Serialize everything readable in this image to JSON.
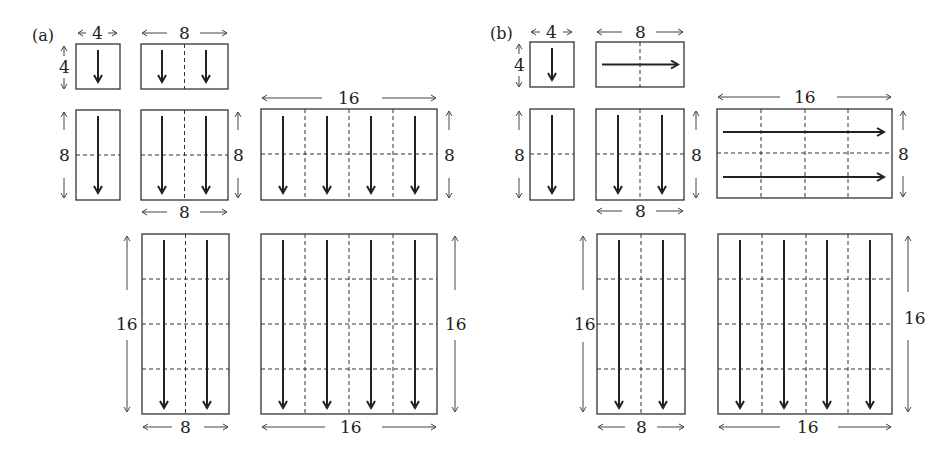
{
  "panels": [
    {
      "label": "(a)",
      "tiles": [
        {
          "w": 4,
          "h": 4,
          "labels": {
            "top": "4",
            "left": "4"
          },
          "direction": "down"
        },
        {
          "w": 8,
          "h": 4,
          "labels": {
            "top": "8"
          },
          "direction": "down"
        },
        {
          "w": 4,
          "h": 8,
          "labels": {
            "left": "8"
          },
          "direction": "down"
        },
        {
          "w": 8,
          "h": 8,
          "labels": {
            "right": "8",
            "bottom": "8"
          },
          "direction": "down"
        },
        {
          "w": 16,
          "h": 8,
          "labels": {
            "top": "16",
            "right": "8"
          },
          "direction": "down"
        },
        {
          "w": 8,
          "h": 16,
          "labels": {
            "left": "16",
            "bottom": "8"
          },
          "direction": "down"
        },
        {
          "w": 16,
          "h": 16,
          "labels": {
            "right": "16",
            "bottom": "16"
          },
          "direction": "down"
        }
      ]
    },
    {
      "label": "(b)",
      "tiles": [
        {
          "w": 4,
          "h": 4,
          "labels": {
            "top": "4",
            "left": "4"
          },
          "direction": "down"
        },
        {
          "w": 8,
          "h": 4,
          "labels": {
            "top": "8"
          },
          "direction": "right"
        },
        {
          "w": 4,
          "h": 8,
          "labels": {
            "left": "8"
          },
          "direction": "down"
        },
        {
          "w": 8,
          "h": 8,
          "labels": {
            "right": "8",
            "bottom": "8"
          },
          "direction": "down"
        },
        {
          "w": 16,
          "h": 8,
          "labels": {
            "top": "16",
            "right": "8"
          },
          "direction": "right"
        },
        {
          "w": 8,
          "h": 16,
          "labels": {
            "left": "16",
            "bottom": "8"
          },
          "direction": "down"
        },
        {
          "w": 16,
          "h": 16,
          "labels": {
            "right": "16",
            "bottom": "16"
          },
          "direction": "down"
        }
      ]
    }
  ],
  "text": {
    "a": "(a)",
    "b": "(b)",
    "four": "4",
    "eight": "8",
    "sixteen": "16"
  }
}
